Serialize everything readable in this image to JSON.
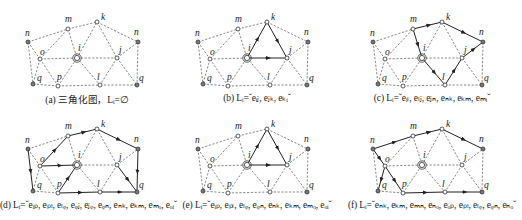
{
  "figure": {
    "nodes": {
      "n1": {
        "label": "n",
        "x": 28,
        "y": 42,
        "type": "filled"
      },
      "o": {
        "label": "o",
        "x": 40,
        "y": 59,
        "type": "open"
      },
      "q1": {
        "label": "q",
        "x": 33,
        "y": 84,
        "type": "filled"
      },
      "p": {
        "label": "p",
        "x": 58,
        "y": 86,
        "type": "open"
      },
      "m": {
        "label": "m",
        "x": 68,
        "y": 29,
        "type": "open"
      },
      "i": {
        "label": "i",
        "x": 77,
        "y": 58,
        "type": "center"
      },
      "k": {
        "label": "k",
        "x": 97,
        "y": 22,
        "type": "open"
      },
      "l": {
        "label": "l",
        "x": 100,
        "y": 85,
        "type": "open"
      },
      "j": {
        "label": "j",
        "x": 117,
        "y": 58,
        "type": "open"
      },
      "n2": {
        "label": "n",
        "x": 138,
        "y": 42,
        "type": "filled"
      },
      "q2": {
        "label": "q",
        "x": 137,
        "y": 85,
        "type": "filled"
      }
    },
    "label_offsets": {
      "n1": [
        -3,
        -6
      ],
      "o": [
        0,
        -4
      ],
      "q1": [
        4,
        -3
      ],
      "p": [
        -1,
        -6
      ],
      "m": [
        -3,
        -7
      ],
      "i": [
        1,
        -7
      ],
      "k": [
        4,
        -2
      ],
      "l": [
        -3,
        -5
      ],
      "j": [
        2,
        -5
      ],
      "n2": [
        -4,
        -7
      ],
      "q2": [
        2,
        -4
      ]
    },
    "edges": [
      [
        "n1",
        "m"
      ],
      [
        "m",
        "k"
      ],
      [
        "k",
        "n2"
      ],
      [
        "n1",
        "o"
      ],
      [
        "n1",
        "q1"
      ],
      [
        "o",
        "m"
      ],
      [
        "o",
        "i"
      ],
      [
        "o",
        "q1"
      ],
      [
        "o",
        "p"
      ],
      [
        "q1",
        "p"
      ],
      [
        "p",
        "i"
      ],
      [
        "p",
        "l"
      ],
      [
        "m",
        "i"
      ],
      [
        "i",
        "k"
      ],
      [
        "i",
        "j"
      ],
      [
        "i",
        "l"
      ],
      [
        "k",
        "j"
      ],
      [
        "j",
        "n2"
      ],
      [
        "j",
        "l"
      ],
      [
        "j",
        "q2"
      ],
      [
        "l",
        "q2"
      ],
      [
        "n2",
        "q2"
      ]
    ]
  },
  "panels": [
    {
      "id": "a",
      "x": 0,
      "y": 0,
      "caption": "(a) 三角化图，Lᵢ=∅",
      "solid_edges": []
    },
    {
      "id": "b",
      "x": 170,
      "y": 0,
      "caption": "(b) Lᵢ=ˇeᵢⱼ, eⱼₖ, eₖᵢˇ",
      "solid_edges": [
        [
          "i",
          "k"
        ],
        [
          "k",
          "j"
        ],
        [
          "i",
          "j"
        ]
      ]
    },
    {
      "id": "c",
      "x": 345,
      "y": 0,
      "caption": "(c) Lᵢ=ˇeᵢₗ, eₗⱼ, eⱼₙ, eₙₖ, eₖₘ, eₘᵢˇ",
      "solid_edges": [
        [
          "i",
          "l"
        ],
        [
          "l",
          "j"
        ],
        [
          "j",
          "n2"
        ],
        [
          "k",
          "n2"
        ],
        [
          "m",
          "k"
        ],
        [
          "m",
          "i"
        ]
      ]
    },
    {
      "id": "d",
      "x": 0,
      "y": 107,
      "caption": "(d) Lᵢ=ˇeᵢₚ, eₚₗ, eₗᵩ, eᵩⱼ, eⱼᵩ, eᵩₙ, eₙₖ, eₖₘ, eₘₒ, eₒᵢˇ",
      "solid_edges": [
        [
          "p",
          "i"
        ],
        [
          "p",
          "l"
        ],
        [
          "l",
          "q2"
        ],
        [
          "j",
          "q2"
        ],
        [
          "n2",
          "q2"
        ],
        [
          "k",
          "n2"
        ],
        [
          "m",
          "k"
        ],
        [
          "o",
          "m"
        ],
        [
          "o",
          "i"
        ],
        [
          "n1",
          "q1"
        ]
      ]
    },
    {
      "id": "e",
      "x": 170,
      "y": 107,
      "caption": "(e) Lᵢ=ˇeᵢₚ, eₚₗ, eₗᵩ, eᵩₙ, eₙₖ, eₖₘ, eₘₒ, eₒᵢˇ",
      "solid_edges": [
        [
          "i",
          "k"
        ],
        [
          "k",
          "j"
        ],
        [
          "i",
          "j"
        ]
      ]
    },
    {
      "id": "f",
      "x": 345,
      "y": 107,
      "caption": "(f) Lᵢ=ˇeₙₖ, eₖₘ, eₘₙ, eₙₒ, eₒₚ, eₚₗ, eₗᵩ, eᵩₙ, eₙₒˇ",
      "solid_edges": [
        [
          "n1",
          "m"
        ],
        [
          "m",
          "k"
        ],
        [
          "k",
          "n2"
        ],
        [
          "n1",
          "o"
        ],
        [
          "o",
          "q1"
        ],
        [
          "o",
          "p"
        ],
        [
          "p",
          "l"
        ],
        [
          "l",
          "q2"
        ]
      ]
    }
  ],
  "colors": {
    "dashed_edge": "#555555",
    "solid_edge": "#222222",
    "filled_node": "#7a7a7a",
    "open_node": "#ffffff",
    "stroke": "#333333"
  }
}
